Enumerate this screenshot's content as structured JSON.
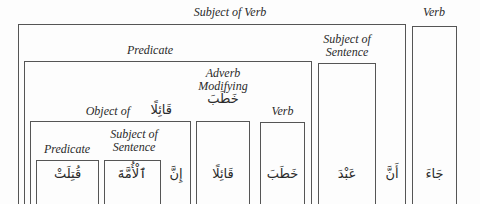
{
  "diagram": {
    "labels": {
      "subject_of_verb": "Subject of Verb",
      "verb_top": "Verb",
      "predicate_top": "Predicate",
      "subject_of_sentence_top_1": "Subject of",
      "subject_of_sentence_top_2": "Sentence",
      "adverb_1": "Adverb",
      "adverb_2": "Modifying",
      "adverb_ar": "خَطَبَ",
      "verb_inner": "Verb",
      "object_of": "Object of",
      "object_of_ar": "قَائِلًا",
      "predicate_inner": "Predicate",
      "subject_inner_1": "Subject of",
      "subject_inner_2": "Sentence"
    },
    "words": {
      "qutilat": "قُتِلَتْ",
      "al_ummah": "ٱلْأُمَّةَ",
      "inna": "إِنَّ",
      "qailan": "قَائِلًا",
      "khataba": "خَطَبَ",
      "abd": "عَبْدَ",
      "anna": "أَنَّ",
      "jaa": "جَاءَ"
    }
  }
}
